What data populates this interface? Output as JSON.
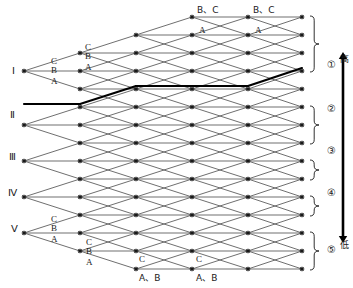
{
  "diagram": {
    "type": "trellis-lattice",
    "title_text": "",
    "state_labels": [
      "Ⅰ",
      "Ⅱ",
      "Ⅲ",
      "Ⅳ",
      "Ⅴ"
    ],
    "group_markers": [
      "①",
      "②",
      "③",
      "④",
      "⑤"
    ],
    "axis": {
      "high_label": "高",
      "low_label": "低",
      "arrow": "double-headed-vertical"
    },
    "edge_labels": {
      "branch_top": [
        "C",
        "B",
        "A"
      ],
      "branch_bottom": [
        "C",
        "B",
        "A"
      ],
      "top_row": [
        "B、C",
        "B、C"
      ],
      "second_row": [
        "A",
        "A"
      ],
      "lower_row": [
        "C",
        "C"
      ],
      "bottom_row": [
        "A、B",
        "A、B"
      ]
    },
    "colors": {
      "line": "#555555",
      "bold_path": "#000000",
      "node": "#1a1a1a",
      "text": "#1a1a1a",
      "background": "#ffffff"
    },
    "geometry": {
      "columns": [
        80,
        136,
        192,
        248,
        302
      ],
      "row_spacing": 18,
      "row_count": 15,
      "top_row_y": 17
    },
    "highlighted_path": {
      "description": "bold survivor path from state II ascending to top-right",
      "nodes": [
        [
          24,
          104
        ],
        [
          80,
          104
        ],
        [
          136,
          86
        ],
        [
          192,
          86
        ],
        [
          248,
          86
        ],
        [
          302,
          68
        ]
      ]
    }
  },
  "labels": {
    "romans": [
      {
        "text": "Ⅰ",
        "x": 12,
        "y": 66
      },
      {
        "text": "Ⅱ",
        "x": 10,
        "y": 110
      },
      {
        "text": "Ⅲ",
        "x": 9,
        "y": 152
      },
      {
        "text": "Ⅳ",
        "x": 8,
        "y": 188
      },
      {
        "text": "Ⅴ",
        "x": 11,
        "y": 224
      }
    ],
    "branches_I": [
      {
        "text": "C",
        "x": 51,
        "y": 57
      },
      {
        "text": "B",
        "x": 51,
        "y": 66
      },
      {
        "text": "A",
        "x": 51,
        "y": 77
      }
    ],
    "branches_I2": [
      {
        "text": "C",
        "x": 85,
        "y": 43
      },
      {
        "text": "B",
        "x": 85,
        "y": 52
      },
      {
        "text": "A",
        "x": 85,
        "y": 63
      }
    ],
    "branches_V": [
      {
        "text": "C",
        "x": 51,
        "y": 215
      },
      {
        "text": "B",
        "x": 51,
        "y": 224
      },
      {
        "text": "A",
        "x": 51,
        "y": 235
      }
    ],
    "branches_V2": [
      {
        "text": "C",
        "x": 86,
        "y": 238
      },
      {
        "text": "B",
        "x": 86,
        "y": 247
      },
      {
        "text": "A",
        "x": 86,
        "y": 258
      }
    ],
    "top": [
      {
        "text": "B、C",
        "x": 197,
        "y": 6
      },
      {
        "text": "B、C",
        "x": 253,
        "y": 6
      }
    ],
    "second": [
      {
        "text": "A",
        "x": 199,
        "y": 26
      },
      {
        "text": "A",
        "x": 255,
        "y": 26
      }
    ],
    "lower": [
      {
        "text": "C",
        "x": 139,
        "y": 255
      },
      {
        "text": "C",
        "x": 196,
        "y": 255
      }
    ],
    "bottom": [
      {
        "text": "A、B",
        "x": 139,
        "y": 274
      },
      {
        "text": "A、B",
        "x": 196,
        "y": 274
      }
    ],
    "groups": [
      {
        "text": "①",
        "x": 327,
        "y": 60
      },
      {
        "text": "②",
        "x": 327,
        "y": 104
      },
      {
        "text": "③",
        "x": 327,
        "y": 146
      },
      {
        "text": "④",
        "x": 327,
        "y": 188
      },
      {
        "text": "⑤",
        "x": 327,
        "y": 245
      }
    ],
    "axis_text": [
      {
        "text": "高",
        "x": 340,
        "y": 55
      },
      {
        "text": "低",
        "x": 340,
        "y": 241
      }
    ]
  }
}
